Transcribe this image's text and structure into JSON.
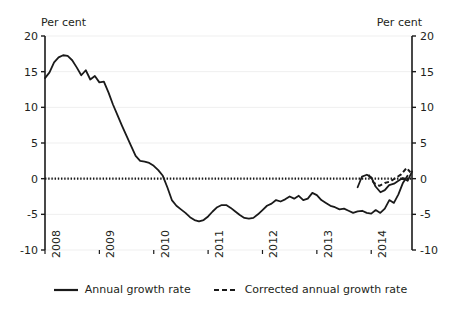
{
  "chart": {
    "unit_label_left": "Per cent",
    "unit_label_right": "Per cent",
    "legend": {
      "series1_label": "Annual growth rate",
      "series2_label": "Corrected annual growth rate"
    }
  },
  "chart_data": {
    "type": "line",
    "title": "",
    "subtitle": "",
    "xlabel": "",
    "ylabel": "Per cent",
    "y2label": "Per cent",
    "grid": true,
    "legend_position": "bottom-center",
    "xlim": [
      2008.0,
      2014.75
    ],
    "ylim": [
      -10,
      20
    ],
    "yticks": [
      20,
      15,
      10,
      5,
      0,
      -5,
      -10
    ],
    "ytick_labels": [
      "20",
      "15",
      "10",
      "5",
      "0",
      "-5",
      "-10"
    ],
    "y2ticks": [
      20,
      15,
      10,
      5,
      0,
      -5,
      -10
    ],
    "y2tick_labels": [
      "20",
      "15",
      "10",
      "5",
      "0",
      "-5",
      "-10"
    ],
    "xticks": [
      2008,
      2009,
      2010,
      2011,
      2012,
      2013,
      2014
    ],
    "xtick_labels": [
      "2008",
      "2009",
      "2010",
      "2011",
      "2012",
      "2013",
      "2014"
    ],
    "zero_line": 0,
    "zero_line_style": "dotted",
    "series": [
      {
        "name": "Annual growth rate",
        "style": "solid",
        "color": "#1a1a1a",
        "x": [
          2008.0,
          2008.083,
          2008.167,
          2008.25,
          2008.333,
          2008.417,
          2008.5,
          2008.583,
          2008.667,
          2008.75,
          2008.833,
          2008.917,
          2009.0,
          2009.083,
          2009.167,
          2009.25,
          2009.333,
          2009.417,
          2009.5,
          2009.583,
          2009.667,
          2009.75,
          2009.833,
          2009.917,
          2010.0,
          2010.083,
          2010.167,
          2010.25,
          2010.333,
          2010.417,
          2010.5,
          2010.583,
          2010.667,
          2010.75,
          2010.833,
          2010.917,
          2011.0,
          2011.083,
          2011.167,
          2011.25,
          2011.333,
          2011.417,
          2011.5,
          2011.583,
          2011.667,
          2011.75,
          2011.833,
          2011.917,
          2012.0,
          2012.083,
          2012.167,
          2012.25,
          2012.333,
          2012.417,
          2012.5,
          2012.583,
          2012.667,
          2012.75,
          2012.833,
          2012.917,
          2013.0,
          2013.083,
          2013.167,
          2013.25,
          2013.333,
          2013.417,
          2013.5,
          2013.583,
          2013.667,
          2013.75,
          2013.833,
          2013.917,
          2014.0,
          2014.083,
          2014.167,
          2014.25,
          2014.333,
          2014.417,
          2014.5,
          2014.583,
          2014.667
        ],
        "y": [
          14.1,
          14.9,
          16.3,
          17.0,
          17.3,
          17.2,
          16.6,
          15.6,
          14.5,
          15.2,
          13.9,
          14.4,
          13.5,
          13.6,
          12.1,
          10.4,
          8.9,
          7.4,
          6.0,
          4.6,
          3.2,
          2.5,
          2.4,
          2.2,
          1.8,
          1.2,
          0.4,
          -1.2,
          -3.0,
          -3.8,
          -4.3,
          -4.8,
          -5.4,
          -5.8,
          -6.0,
          -5.8,
          -5.3,
          -4.6,
          -4.0,
          -3.7,
          -3.7,
          -4.1,
          -4.6,
          -5.1,
          -5.5,
          -5.6,
          -5.5,
          -5.0,
          -4.4,
          -3.8,
          -3.5,
          -3.0,
          -3.2,
          -2.9,
          -2.5,
          -2.8,
          -2.4,
          -3.0,
          -2.8,
          -2.0,
          -2.3,
          -3.0,
          -3.4,
          -3.8,
          -4.0,
          -4.3,
          -4.2,
          -4.5,
          -4.8,
          -4.6,
          -4.5,
          -4.8,
          -4.9,
          -4.4,
          -4.8,
          -4.2,
          -3.0,
          -3.4,
          -2.2,
          -0.6,
          0.4
        ],
        "segments_note": "continues below in y_tail"
      },
      {
        "name": "Corrected annual growth rate",
        "style": "dashed",
        "color": "#1a1a1a",
        "x": [
          2013.95,
          2014.05,
          2014.15,
          2014.25,
          2014.35,
          2014.45,
          2014.55,
          2014.65,
          2014.72
        ],
        "y": [
          0.55,
          -0.6,
          -1.0,
          -0.6,
          -0.4,
          0.1,
          0.6,
          1.5,
          0.9
        ]
      }
    ],
    "series_tail": {
      "name": "Annual growth rate (2013.8-2014.75)",
      "x": [
        2013.75,
        2013.83,
        2013.92,
        2014.0,
        2014.08,
        2014.17,
        2014.25,
        2014.33,
        2014.42,
        2014.5,
        2014.58,
        2014.67,
        2014.75
      ],
      "y": [
        -1.2,
        0.3,
        0.55,
        0.2,
        -1.1,
        -1.9,
        -1.6,
        -0.9,
        -0.7,
        -0.3,
        0.1,
        -0.3,
        1.0
      ]
    }
  }
}
